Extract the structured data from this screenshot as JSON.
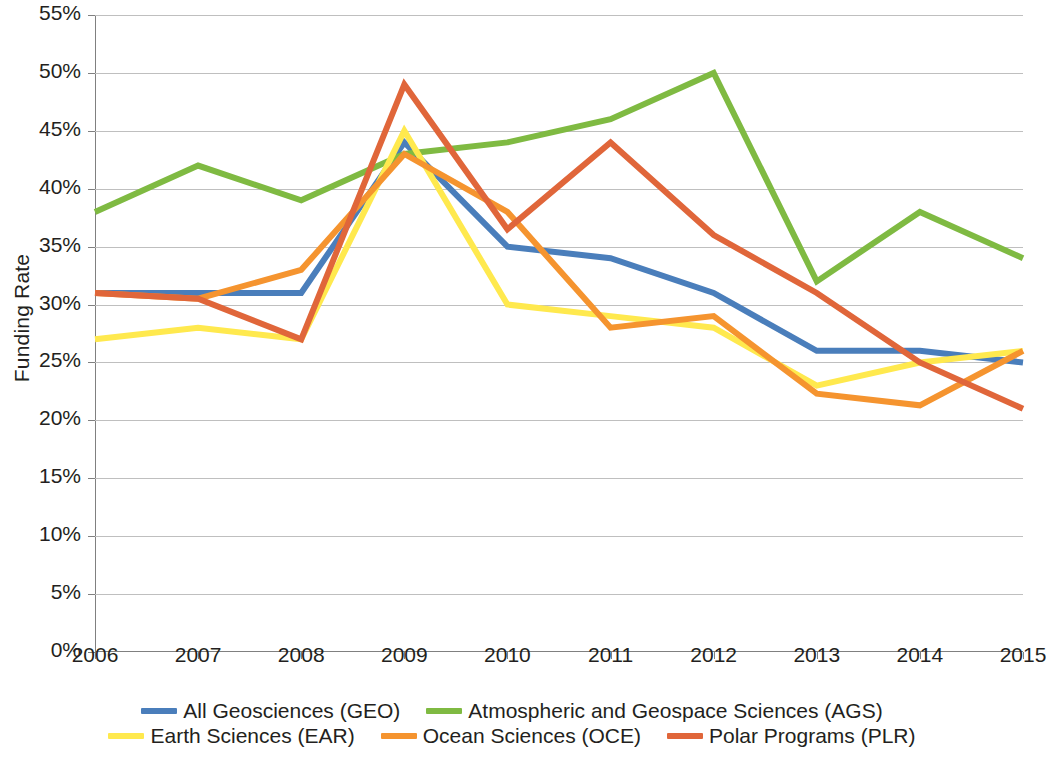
{
  "chart_data": {
    "type": "line",
    "title": "",
    "xlabel": "",
    "ylabel": "Funding Rate",
    "x": [
      2006,
      2007,
      2008,
      2009,
      2010,
      2011,
      2012,
      2013,
      2014,
      2015
    ],
    "xtick_labels": [
      "2006",
      "2007",
      "2008",
      "2009",
      "2010",
      "2011",
      "2012",
      "2013",
      "2014",
      "2015"
    ],
    "ytick_labels": [
      "0%",
      "5%",
      "10%",
      "15%",
      "20%",
      "25%",
      "30%",
      "35%",
      "40%",
      "45%",
      "50%",
      "55%"
    ],
    "ytick_values": [
      0,
      5,
      10,
      15,
      20,
      25,
      30,
      35,
      40,
      45,
      50,
      55
    ],
    "ylim": [
      0,
      55
    ],
    "xlim": [
      2006,
      2015
    ],
    "grid": true,
    "legend_position": "bottom",
    "value_unit": "percent",
    "series": [
      {
        "name": "All Geosciences (GEO)",
        "short": "GEO",
        "color": "#4a7ebb",
        "values": [
          31,
          31,
          31,
          44,
          35,
          34,
          31,
          26,
          26,
          25
        ]
      },
      {
        "name": "Atmospheric and Geospace Sciences (AGS)",
        "short": "AGS",
        "color": "#7fba42",
        "values": [
          38,
          42,
          39,
          43,
          44,
          46,
          50,
          32,
          38,
          34
        ]
      },
      {
        "name": "Earth Sciences (EAR)",
        "short": "EAR",
        "color": "#ffe94e",
        "values": [
          27,
          28,
          27,
          45,
          30,
          29,
          28,
          23,
          25,
          26
        ]
      },
      {
        "name": "Ocean Sciences (OCE)",
        "short": "OCE",
        "color": "#f5942f",
        "values": [
          31,
          30.5,
          33,
          43,
          38,
          28,
          29,
          22.3,
          21.3,
          26
        ]
      },
      {
        "name": "Polar Programs (PLR)",
        "short": "PLR",
        "color": "#e0663a",
        "values": [
          31,
          30.5,
          27,
          49,
          36.5,
          44,
          36,
          31,
          25,
          21
        ]
      }
    ]
  },
  "legend": {
    "row1": [
      {
        "label": "All Geosciences (GEO)",
        "color": "#4a7ebb"
      },
      {
        "label": "Atmospheric and Geospace Sciences (AGS)",
        "color": "#7fba42"
      }
    ],
    "row2": [
      {
        "label": "Earth Sciences (EAR)",
        "color": "#ffe94e"
      },
      {
        "label": "Ocean Sciences (OCE)",
        "color": "#f5942f"
      },
      {
        "label": "Polar Programs (PLR)",
        "color": "#e0663a"
      }
    ]
  }
}
